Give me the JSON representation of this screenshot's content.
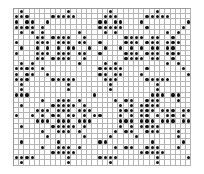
{
  "pattern": {
    "columns": 34,
    "rows": 30,
    "dot_color": "#111111",
    "grid_color": "#b4b4b4",
    "cells": [
      "0100000000100000001000000001000000",
      "1110000111110000011100000111110000",
      "1011001000000000110110001000000001",
      "1111010000000000111110000100000010",
      "0101010000001000010100000000010100",
      "0000110111100100000001111011001000",
      "1000111011101100100001110111011100",
      "0100101010110010010010101011011000",
      "1000111011101100100001110111011100",
      "0000110111100100000001111011001000",
      "0101000000001000010100000000010100",
      "1111010000000000111110000100000010",
      "1011001000000000110110001000000001",
      "1110000111110000011100000111110000",
      "0100000000100000001000000001000000",
      "0100000000100000001000000001000000",
      "1110000000000001000000000011101100",
      "0000010011101000000101100111000100",
      "0100000111110100000010101111000000",
      "0000111011101110000011101110111011",
      "1001010110110101100010101101011010",
      "0000111011101110000011101110111011",
      "0100000111110100000010101111000000",
      "0000010011101000000101100111000100",
      "0000001000000100001000010000000100",
      "0100000010000000110000000010000010",
      "0000010011101000000101100111000100",
      "0000000111110000000000001111100000",
      "1111000000100000111100000001000001",
      "0100000000100000001000000001000000"
    ]
  }
}
